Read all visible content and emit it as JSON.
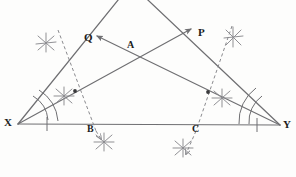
{
  "figure": {
    "type": "geometry-construction",
    "width": 296,
    "height": 177,
    "background_color": "#fdfdfc",
    "stroke_color": "#6f6f72",
    "construction_color": "#8a8a8e",
    "label_color": "#1c1c1c"
  },
  "labels": [
    {
      "id": "X",
      "text": "X",
      "x": 4,
      "y": 117,
      "role": "vertex-label"
    },
    {
      "id": "Y",
      "text": "Y",
      "x": 283,
      "y": 119,
      "role": "vertex-label"
    },
    {
      "id": "P",
      "text": "P",
      "x": 198,
      "y": 27,
      "role": "ray-endpoint-label"
    },
    {
      "id": "Q",
      "text": "Q",
      "x": 84,
      "y": 32,
      "role": "ray-endpoint-label"
    },
    {
      "id": "A",
      "text": "A",
      "x": 127,
      "y": 40,
      "role": "intersection-label"
    },
    {
      "id": "B",
      "text": "B",
      "x": 87,
      "y": 124,
      "role": "foot-point-label"
    },
    {
      "id": "C",
      "text": "C",
      "x": 192,
      "y": 124,
      "role": "foot-point-label"
    }
  ],
  "points": {
    "X": {
      "x": 18,
      "y": 124
    },
    "Y": {
      "x": 280,
      "y": 125
    },
    "apex": {
      "x": 131,
      "y": -16
    },
    "A": {
      "x": 131,
      "y": 56
    },
    "B": {
      "x": 93,
      "y": 124
    },
    "C": {
      "x": 199,
      "y": 124
    },
    "P": {
      "x": 193,
      "y": 28
    },
    "Q": {
      "x": 95,
      "y": 35
    },
    "M_left": {
      "x": 75,
      "y": 91
    },
    "M_right": {
      "x": 208,
      "y": 92
    }
  },
  "segments": [
    {
      "name": "base-XY",
      "from": "X",
      "to": "Y",
      "style": "solid"
    },
    {
      "name": "side-X-apex",
      "from": "X",
      "to": "apex",
      "style": "solid"
    },
    {
      "name": "side-Y-apex",
      "from": "Y",
      "to": "apex",
      "style": "solid"
    },
    {
      "name": "ray-X-to-P",
      "from": "X",
      "to": "P",
      "style": "solid-arrow"
    },
    {
      "name": "ray-Y-to-Q",
      "from": "Y",
      "to": "Q",
      "style": "solid-arrow"
    },
    {
      "name": "perp-B-dashed",
      "from": "B",
      "to": "M_left",
      "style": "dashed"
    },
    {
      "name": "perp-C-dashed",
      "from": "C",
      "to": "M_right",
      "style": "dashed"
    }
  ],
  "markers": {
    "angle_arcs": [
      {
        "name": "angle-arc-X",
        "at": "X",
        "count": 2
      },
      {
        "name": "angle-arc-Y",
        "at": "Y",
        "count": 2
      }
    ],
    "tick_marks": [
      {
        "name": "tick-base-left",
        "x": 47,
        "y": 124
      },
      {
        "name": "tick-base-right",
        "x": 257,
        "y": 125
      }
    ],
    "dots": [
      {
        "name": "dot-left-ray",
        "x": 75,
        "y": 91
      },
      {
        "name": "dot-right-ray",
        "x": 208,
        "y": 92
      }
    ],
    "arc_crosses": [
      {
        "name": "arc-cross-upper-left",
        "x": 46,
        "y": 43
      },
      {
        "name": "arc-cross-upper-right",
        "x": 233,
        "y": 37
      },
      {
        "name": "arc-cross-mid-left",
        "x": 64,
        "y": 96
      },
      {
        "name": "arc-cross-mid-right",
        "x": 222,
        "y": 98
      },
      {
        "name": "arc-cross-below-B",
        "x": 104,
        "y": 142
      },
      {
        "name": "arc-cross-below-C",
        "x": 183,
        "y": 148
      }
    ]
  }
}
